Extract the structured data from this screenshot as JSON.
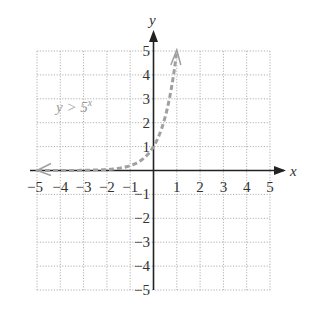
{
  "chart_data": {
    "type": "line",
    "title": "",
    "xlabel": "x",
    "ylabel": "y",
    "xlim": [
      -5,
      5
    ],
    "ylim": [
      -5,
      5
    ],
    "grid": true,
    "x_ticks": [
      "−5",
      "−4",
      "−3",
      "−2",
      "−1",
      "1",
      "2",
      "3",
      "4",
      "5"
    ],
    "y_ticks": [
      "5",
      "4",
      "3",
      "2",
      "1",
      "−1",
      "−2",
      "−3",
      "−4",
      "−5"
    ],
    "series": [
      {
        "name": "y > 5^x",
        "style": "dashed",
        "color": "#a0a0a0",
        "function": "5^x",
        "x": [
          -5,
          -4,
          -3,
          -2,
          -1,
          -0.5,
          0,
          0.5,
          0.75,
          1
        ],
        "y": [
          0.0003,
          0.0016,
          0.008,
          0.04,
          0.2,
          0.447,
          1,
          2.236,
          3.344,
          5
        ]
      }
    ],
    "annotations": [
      {
        "text_main": "y > 5",
        "text_sup": "x",
        "x": -4,
        "y": 2.3
      }
    ]
  },
  "labels": {
    "x_axis": "x",
    "y_axis": "y",
    "equation_main": "y > 5",
    "equation_sup": "x"
  },
  "colors": {
    "axis": "#222222",
    "grid": "#b0b0b0",
    "curve": "#a0a0a0"
  }
}
